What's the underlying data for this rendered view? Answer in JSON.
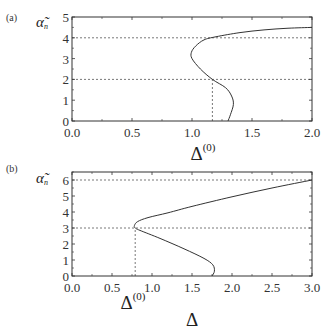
{
  "chart_data": [
    {
      "type": "line",
      "panel_label": "(a)",
      "ylabel": "α̃",
      "ylabel_subscript": "n",
      "xlabel": "Δ",
      "xlabel_sup": "(0)",
      "xlim": [
        0.0,
        2.0
      ],
      "ylim": [
        0,
        5
      ],
      "xticks": [
        "0.0",
        "0.5",
        "1.0",
        "1.5",
        "2.0"
      ],
      "yticks": [
        "0",
        "1",
        "2",
        "3",
        "4",
        "5"
      ],
      "hlines_dashed": [
        2,
        4
      ],
      "vline_dashed": {
        "x": 1.17,
        "y_to": 2
      },
      "series": [
        {
          "name": "alpha_n vs Delta0",
          "points": [
            [
              1.3,
              0.0
            ],
            [
              1.32,
              0.3
            ],
            [
              1.345,
              0.8
            ],
            [
              1.33,
              1.2
            ],
            [
              1.28,
              1.6
            ],
            [
              1.17,
              2.0
            ],
            [
              1.07,
              2.5
            ],
            [
              1.0,
              3.0
            ],
            [
              0.995,
              3.3
            ],
            [
              1.03,
              3.6
            ],
            [
              1.1,
              3.9
            ],
            [
              1.2,
              4.05
            ],
            [
              1.4,
              4.25
            ],
            [
              1.6,
              4.38
            ],
            [
              1.8,
              4.46
            ],
            [
              2.0,
              4.5
            ]
          ]
        }
      ],
      "grid": false
    },
    {
      "type": "line",
      "panel_label": "(b)",
      "ylabel": "α̃",
      "ylabel_subscript": "n",
      "xlabel": "Δ",
      "marker_label": "Δ",
      "marker_label_sup": "(0)",
      "xlim": [
        0.0,
        3.0
      ],
      "ylim": [
        0,
        6.5
      ],
      "xticks": [
        "0.0",
        "0.5",
        "1.0",
        "1.5",
        "2.0",
        "2.5",
        "3.0"
      ],
      "yticks": [
        "0",
        "1",
        "2",
        "3",
        "4",
        "5",
        "6"
      ],
      "hlines_dashed": [
        3,
        6
      ],
      "vline_dashed": {
        "x": 0.79,
        "y_to": 3
      },
      "series": [
        {
          "name": "alpha_n vs Delta",
          "points": [
            [
              1.75,
              0.0
            ],
            [
              1.78,
              0.3
            ],
            [
              1.76,
              0.7
            ],
            [
              1.65,
              1.1
            ],
            [
              1.4,
              1.7
            ],
            [
              1.1,
              2.35
            ],
            [
              0.85,
              2.85
            ],
            [
              0.79,
              3.0
            ],
            [
              0.78,
              3.15
            ],
            [
              0.82,
              3.4
            ],
            [
              0.95,
              3.65
            ],
            [
              1.2,
              3.95
            ],
            [
              1.5,
              4.35
            ],
            [
              2.0,
              4.95
            ],
            [
              2.5,
              5.5
            ],
            [
              3.0,
              6.0
            ]
          ]
        }
      ],
      "grid": false
    }
  ]
}
